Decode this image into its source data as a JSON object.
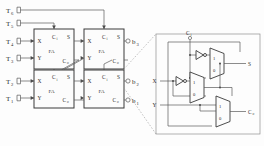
{
  "figure": {
    "type": "logic-circuit-schematic"
  },
  "colors": {
    "ink": "#2b2b2b",
    "wire": "#5a5a5a",
    "box_stroke": "#3a3a3a",
    "callout_dash": "#9a9a9a",
    "background": "#ffffff"
  },
  "inputs": [
    {
      "id": "t6",
      "base": "T",
      "sub": "6",
      "x": 6,
      "y": 10
    },
    {
      "id": "t5",
      "base": "T",
      "sub": "5",
      "x": 6,
      "y": 23
    },
    {
      "id": "t4",
      "base": "T",
      "sub": "4",
      "x": 6,
      "y": 41
    },
    {
      "id": "t3",
      "base": "T",
      "sub": "3",
      "x": 6,
      "y": 58
    },
    {
      "id": "t2",
      "base": "T",
      "sub": "2",
      "x": 6,
      "y": 81
    },
    {
      "id": "t1",
      "base": "T",
      "sub": "1",
      "x": 6,
      "y": 98
    }
  ],
  "outputs": [
    {
      "id": "b3",
      "base": "b",
      "sub": "3",
      "x": 131,
      "y": 37
    },
    {
      "id": "b2",
      "base": "b",
      "sub": "2",
      "x": 131,
      "y": 95
    },
    {
      "id": "b1",
      "base": "b",
      "sub": "1",
      "x": 131,
      "y": 110
    }
  ],
  "adders": [
    {
      "id": "fa-top-left",
      "name": "FA",
      "ports": {
        "x": "X",
        "y": "Y",
        "ci_base": "C",
        "ci_sub": "i",
        "s": "S",
        "co_base": "C",
        "co_sub": "o"
      }
    },
    {
      "id": "fa-top-right",
      "name": "FA",
      "ports": {
        "x": "X",
        "y": "Y",
        "ci_base": "C",
        "ci_sub": "i",
        "s": "S",
        "co_base": "C",
        "co_sub": "o"
      }
    },
    {
      "id": "fa-bottom-left",
      "name": "FA",
      "ports": {
        "x": "X",
        "y": "Y",
        "ci_base": "C",
        "ci_sub": "i",
        "s": "S",
        "co_base": "C",
        "co_sub": "o"
      }
    },
    {
      "id": "fa-bottom-right",
      "name": "FA",
      "ports": {
        "x": "X",
        "y": "Y",
        "ci_base": "C",
        "ci_sub": "i",
        "s": "S",
        "co_base": "C",
        "co_sub": "o"
      }
    }
  ],
  "detail": {
    "caption": "",
    "inputs": [
      {
        "id": "det-ci",
        "base": "C",
        "sub": "i"
      },
      {
        "id": "det-x",
        "base": "X",
        "sub": ""
      },
      {
        "id": "det-y",
        "base": "Y",
        "sub": ""
      }
    ],
    "outputs": [
      {
        "id": "det-s",
        "base": "S",
        "sub": ""
      },
      {
        "id": "det-co",
        "base": "C",
        "sub": "o"
      }
    ],
    "muxes": [
      {
        "id": "mux-sum",
        "top_input": "1",
        "bottom_input": "0"
      },
      {
        "id": "mux-x",
        "top_input": "1",
        "bottom_input": "0"
      },
      {
        "id": "mux-carry",
        "top_input": "1",
        "bottom_input": "0"
      }
    ],
    "inverters": [
      {
        "id": "inv-ci"
      },
      {
        "id": "inv-x"
      }
    ]
  }
}
